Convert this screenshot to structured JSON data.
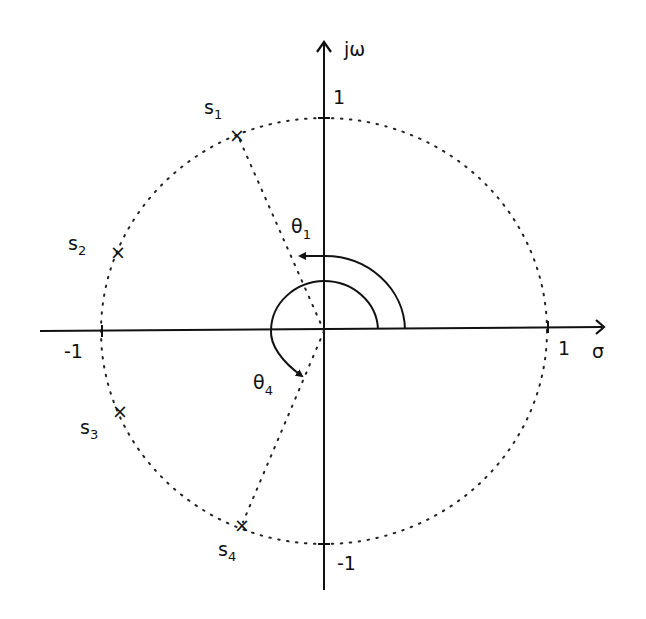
{
  "diagram": {
    "title": "",
    "type": "s-plane pole diagram",
    "axes": {
      "imag_label": "jω",
      "real_label": "σ",
      "ticks": {
        "real_pos": "1",
        "real_neg": "-1",
        "imag_pos": "1",
        "imag_neg": "-1"
      }
    },
    "unit_circle": "dotted",
    "poles": [
      {
        "name": "s",
        "sub": "1",
        "marker": "×"
      },
      {
        "name": "s",
        "sub": "2",
        "marker": "×"
      },
      {
        "name": "s",
        "sub": "3",
        "marker": "×"
      },
      {
        "name": "s",
        "sub": "4",
        "marker": "×"
      }
    ],
    "angles": [
      {
        "name": "θ",
        "sub": "1"
      },
      {
        "name": "θ",
        "sub": "4"
      }
    ],
    "colors": {
      "ink": "#111111",
      "background": "#ffffff"
    }
  }
}
